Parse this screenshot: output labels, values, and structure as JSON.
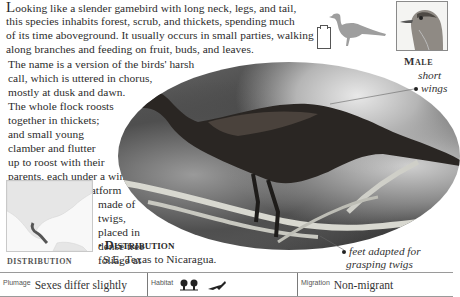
{
  "article": {
    "intro_dropcap": "L",
    "lines": [
      "ooking like a slender gamebird with long neck, legs, and tail,",
      "this species inhabits forest, scrub, and thickets, spending much",
      "of its time aboveground. It usually occurs in small parties, walking",
      "along branches and feeding on fruit, buds, and leaves.",
      "The name is a version of the birds' harsh",
      "call, which is uttered in chorus,",
      "mostly at dusk and dawn.",
      "The whole flock roosts",
      "together in thickets;",
      "and small young",
      "clamber and flutter",
      "up to roost with their",
      "parents, each under a wing."
    ],
    "nest": {
      "bullet": "•",
      "heading": "Nest",
      "lines": [
        "A small platform",
        "made of",
        "twigs,",
        "placed in",
        "dense tree",
        "foliage at",
        "medium height."
      ]
    },
    "distribution": {
      "bullet": "•",
      "heading": "Distribution",
      "text": "S.E. Texas to Nicaragua."
    }
  },
  "illustrations": {
    "male_label": "Male",
    "map_caption": "DISTRIBUTION",
    "size_icon": "clipboard-size-icon",
    "silhouette_icon": "bird-silhouette-icon"
  },
  "annotations": {
    "short_wings": [
      "short",
      "wings"
    ],
    "feet": [
      "feet adapted for",
      "grasping twigs"
    ]
  },
  "facts_table": {
    "plumage": {
      "label": "Plumage",
      "value": "Sexes differ slightly"
    },
    "habitat": {
      "label": "Habitat",
      "icons": [
        "forest-trees-icon",
        "scrub-bird-icon"
      ]
    },
    "migration": {
      "label": "Migration",
      "value": "Non-migrant"
    }
  },
  "colors": {
    "text": "#2b2b2b",
    "silhouette": "#9e9e9e",
    "rule": "#9a9a9a"
  }
}
